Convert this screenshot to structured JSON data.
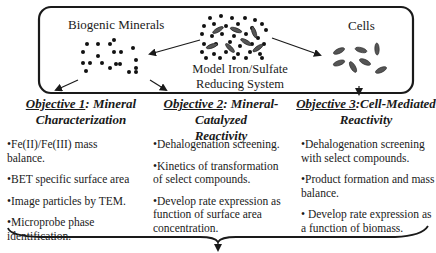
{
  "top_box": {
    "left_label": "Biogenic Minerals",
    "center_label_line1": "Model Iron/Sulfate",
    "center_label_line2": "Reducing System",
    "right_label": "Cells"
  },
  "objectives": [
    {
      "prefix": "Objective 1",
      "title_rest": ": Mineral",
      "title_line2": "Characterization",
      "bullets": [
        "•Fe(II)/Fe(III) mass balance.",
        "•BET specific surface area",
        "•Image particles by TEM.",
        "•Microprobe phase identification."
      ]
    },
    {
      "prefix": "Objective 2",
      "title_rest": ": Mineral-Catalyzed",
      "title_line2": "Reactivity",
      "bullets": [
        "•Dehalogenation screening.",
        "•Kinetics of transformation of select compounds.",
        "•Develop rate expression as function of surface area concentration."
      ]
    },
    {
      "prefix": "Objective 3",
      "title_rest": ":Cell-Mediated",
      "title_line2": "Reactivity",
      "bullets": [
        "•Dehalogenation screening with select compounds.",
        "•Product formation and mass balance.",
        "• Develop rate expression as a function of biomass."
      ]
    }
  ],
  "colors": {
    "ink": "#1a1a1a",
    "cell_fill": "#555555"
  }
}
